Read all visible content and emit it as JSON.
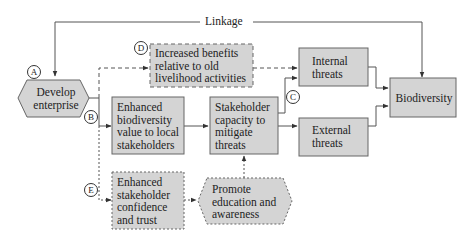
{
  "diagram": {
    "linkage_label": "Linkage",
    "markers": {
      "a": "A",
      "b": "B",
      "c": "C",
      "d": "D",
      "e": "E"
    },
    "nodes": {
      "develop_enterprise": "Develop enterprise",
      "increased_benefits": "Increased benefits relative to old livelihood activities",
      "enhanced_biodiversity": "Enhanced biodiversity value to local stakeholders",
      "stakeholder_capacity": "Stakeholder capacity to mitigate threats",
      "internal_threats": "Internal threats",
      "external_threats": "External threats",
      "biodiversity": "Biodiversity",
      "enhanced_confidence": "Enhanced stakeholder confidence and trust",
      "promote_education": "Promote education and awareness"
    },
    "colors": {
      "box_fill": "#d4d4d4",
      "box_stroke": "#555555",
      "line": "#444444"
    }
  }
}
